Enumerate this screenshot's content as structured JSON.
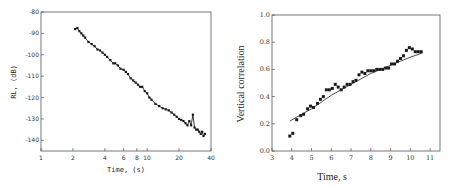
{
  "chart_data": [
    {
      "type": "scatter",
      "title": "",
      "xlabel": "Time, (s)",
      "ylabel": "RL, (dB)",
      "xscale": "log",
      "xlim": [
        1,
        40
      ],
      "ylim": [
        -145,
        -80
      ],
      "xticks": [
        1,
        2,
        4,
        6,
        8,
        10,
        20,
        40
      ],
      "xtick_labels": [
        "1",
        "2",
        "4",
        "6",
        "8",
        "10",
        "20",
        "40"
      ],
      "yticks": [
        -80,
        -90,
        -100,
        -110,
        -120,
        -130,
        -140
      ],
      "ytick_labels": [
        "-80",
        "-90",
        "-100",
        "-110",
        "-120",
        "-130",
        "-140"
      ],
      "grid": false,
      "legend": null,
      "series": [
        {
          "name": "RL measurements",
          "marker": "square-line",
          "x": [
            2.1,
            2.2,
            2.3,
            2.4,
            2.5,
            2.6,
            2.8,
            3.0,
            3.2,
            3.4,
            3.6,
            3.8,
            4.0,
            4.2,
            4.5,
            4.8,
            5.0,
            5.3,
            5.6,
            6.0,
            6.3,
            6.6,
            7.0,
            7.4,
            7.8,
            8.2,
            8.6,
            9.0,
            9.5,
            10.0,
            10.5,
            11,
            12,
            13,
            14,
            15,
            16,
            17,
            18,
            19,
            20,
            21,
            22,
            23,
            24,
            25,
            26,
            27,
            28,
            29,
            30,
            31,
            32,
            33,
            34,
            35
          ],
          "y": [
            -88,
            -87.5,
            -89,
            -90,
            -91,
            -92,
            -94,
            -95,
            -96,
            -97.5,
            -98,
            -99,
            -100,
            -101,
            -102.5,
            -104,
            -104,
            -105,
            -106.5,
            -107,
            -108,
            -109,
            -111,
            -112,
            -113,
            -114,
            -115,
            -115,
            -117,
            -118,
            -120,
            -121,
            -123,
            -124,
            -125,
            -125.5,
            -126,
            -127,
            -128,
            -129,
            -130,
            -130.5,
            -131,
            -132,
            -133,
            -131,
            -133,
            -128,
            -134,
            -135,
            -135,
            -136,
            -137,
            -136,
            -138,
            -137
          ]
        }
      ]
    },
    {
      "type": "scatter",
      "title": "",
      "xlabel": "Time, s",
      "ylabel": "Vertical correlation",
      "xlim": [
        3,
        11.5
      ],
      "ylim": [
        0.0,
        1.0
      ],
      "xticks": [
        3,
        4,
        5,
        6,
        7,
        8,
        9,
        10,
        11
      ],
      "xtick_labels": [
        "3",
        "4",
        "5",
        "6",
        "7",
        "8",
        "9",
        "10",
        "11"
      ],
      "yticks": [
        0.0,
        0.2,
        0.4,
        0.6,
        0.8,
        1.0
      ],
      "ytick_labels": [
        "0.0",
        "0.2",
        "0.4",
        "0.6",
        "0.8",
        "1.0"
      ],
      "grid": false,
      "legend": null,
      "series": [
        {
          "name": "measured",
          "marker": "square",
          "x": [
            3.9,
            4.05,
            4.25,
            4.45,
            4.6,
            4.8,
            4.95,
            5.1,
            5.3,
            5.45,
            5.6,
            5.75,
            5.9,
            6.05,
            6.2,
            6.35,
            6.5,
            6.65,
            6.8,
            6.95,
            7.1,
            7.25,
            7.4,
            7.55,
            7.7,
            7.85,
            8.0,
            8.15,
            8.3,
            8.45,
            8.6,
            8.75,
            8.9,
            9.05,
            9.2,
            9.35,
            9.5,
            9.65,
            9.8,
            9.95,
            10.1,
            10.25,
            10.4,
            10.55
          ],
          "y": [
            0.11,
            0.13,
            0.23,
            0.26,
            0.27,
            0.31,
            0.33,
            0.32,
            0.35,
            0.38,
            0.4,
            0.45,
            0.45,
            0.46,
            0.49,
            0.47,
            0.45,
            0.47,
            0.49,
            0.49,
            0.51,
            0.52,
            0.56,
            0.58,
            0.57,
            0.59,
            0.59,
            0.59,
            0.6,
            0.6,
            0.6,
            0.61,
            0.61,
            0.64,
            0.64,
            0.66,
            0.68,
            0.7,
            0.74,
            0.76,
            0.75,
            0.73,
            0.73,
            0.73
          ]
        },
        {
          "name": "fit",
          "marker": "line",
          "x": [
            3.9,
            4.5,
            5.0,
            5.5,
            6.0,
            6.5,
            7.0,
            7.5,
            8.0,
            8.5,
            9.0,
            9.5,
            10.0,
            10.6
          ],
          "y": [
            0.22,
            0.27,
            0.31,
            0.36,
            0.41,
            0.45,
            0.49,
            0.53,
            0.57,
            0.6,
            0.63,
            0.66,
            0.69,
            0.72
          ]
        }
      ]
    }
  ]
}
